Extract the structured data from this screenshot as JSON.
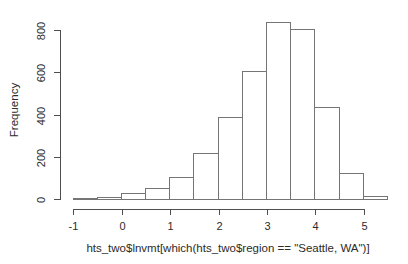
{
  "figure": {
    "background": "#ffffff",
    "axis_color": "#4f4f4f",
    "bar_fill": "#ffffff",
    "bar_border": "#757575",
    "text_color": "#2b2b2b"
  },
  "chart_data": {
    "type": "bar",
    "chart_kind": "histogram",
    "title": "",
    "xlabel": "hts_two$lnvmt[which(hts_two$region == \"Seattle, WA\")]",
    "ylabel": "Frequency",
    "bins": [
      {
        "x0": -1.0,
        "x1": -0.5,
        "count": 5
      },
      {
        "x0": -0.5,
        "x1": 0.0,
        "count": 10
      },
      {
        "x0": 0.0,
        "x1": 0.5,
        "count": 30
      },
      {
        "x0": 0.5,
        "x1": 1.0,
        "count": 50
      },
      {
        "x0": 1.0,
        "x1": 1.5,
        "count": 105
      },
      {
        "x0": 1.5,
        "x1": 2.0,
        "count": 220
      },
      {
        "x0": 2.0,
        "x1": 2.5,
        "count": 390
      },
      {
        "x0": 2.5,
        "x1": 3.0,
        "count": 605
      },
      {
        "x0": 3.0,
        "x1": 3.5,
        "count": 840
      },
      {
        "x0": 3.5,
        "x1": 4.0,
        "count": 805
      },
      {
        "x0": 4.0,
        "x1": 4.5,
        "count": 435
      },
      {
        "x0": 4.5,
        "x1": 5.0,
        "count": 125
      },
      {
        "x0": 5.0,
        "x1": 5.5,
        "count": 15
      }
    ],
    "x_ticks": [
      -1,
      0,
      1,
      2,
      3,
      4,
      5
    ],
    "y_ticks": [
      0,
      200,
      400,
      600,
      800
    ],
    "xlim": [
      -1,
      5.5
    ],
    "ylim": [
      0,
      800
    ],
    "grid": false,
    "legend": null
  }
}
